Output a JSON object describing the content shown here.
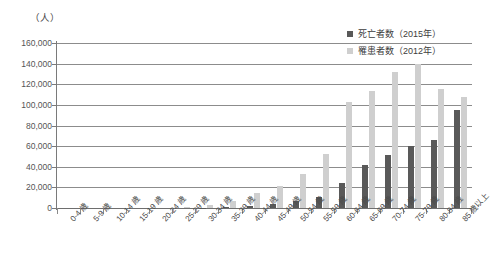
{
  "unit_label": "（人）",
  "legend": {
    "position": "top-right",
    "entries": [
      {
        "label": "死亡者数（2015年）",
        "color": "#595959",
        "key": "death"
      },
      {
        "label": "罹患者数（2012年）",
        "color": "#cfcfcf",
        "key": "incidence"
      }
    ]
  },
  "axis": {
    "y_ticks": [
      "160,000",
      "140,000",
      "120,000",
      "100,000",
      "80,000",
      "60,000",
      "40,000",
      "20,000",
      "0"
    ]
  },
  "chart_data": {
    "type": "bar",
    "title": "",
    "subtitle": "",
    "xlabel": "",
    "ylabel": "（人）",
    "ylim": [
      0,
      160000
    ],
    "ytick_step": 20000,
    "grid": true,
    "legend_position": "top-right",
    "categories": [
      "0-4 歳",
      "5-9 歳",
      "10-14 歳",
      "15-19 歳",
      "20-24 歳",
      "25-29 歳",
      "30-34 歳",
      "35-39 歳",
      "40-44 歳",
      "45-49 歳",
      "50-54 歳",
      "55-59 歳",
      "60-64 歳",
      "65-69 歳",
      "70-74 歳",
      "75-79 歳",
      "80-84 歳",
      "85 歳以上"
    ],
    "series": [
      {
        "name": "死亡者数（2015 年）",
        "color": "#595959",
        "values": [
          0,
          0,
          0,
          0,
          0,
          0,
          200,
          600,
          1500,
          3500,
          6500,
          11000,
          24000,
          42000,
          51000,
          60000,
          66000,
          95000
        ]
      },
      {
        "name": "罹患者数（2012 年）",
        "color": "#cfcfcf",
        "values": [
          0,
          0,
          0,
          0,
          0,
          500,
          2500,
          7000,
          15000,
          21000,
          33000,
          52000,
          103000,
          113000,
          132000,
          140000,
          115000,
          108000
        ]
      }
    ]
  }
}
